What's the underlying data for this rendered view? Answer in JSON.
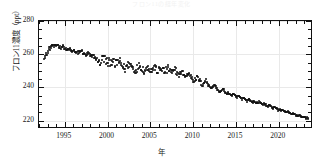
{
  "chart_data": {
    "type": "scatter",
    "title": "フロン11の経年変化",
    "xlabel": "年",
    "ylabel": "フロン11濃度（ppt）",
    "xlim": [
      1992,
      2024
    ],
    "ylim": [
      215,
      280
    ],
    "xticks": [
      1995,
      2000,
      2005,
      2010,
      2015,
      2020
    ],
    "yticks": [
      220,
      240,
      260,
      280
    ],
    "xtick_labels": [
      "1995",
      "2000",
      "2005",
      "2010",
      "2015",
      "2020"
    ],
    "ytick_labels": [
      "220",
      "240",
      "260",
      "280"
    ],
    "xtick_minor_step": 1,
    "ytick_minor_step": 5,
    "grid": true,
    "legend": null,
    "marker": "filled-circle",
    "marker_color": "#111111",
    "series": [
      {
        "name": "フロン11濃度",
        "units": "ppt",
        "x": [
          1992.6,
          1992.8,
          1993.0,
          1993.2,
          1993.4,
          1993.5,
          1993.7,
          1993.9,
          1994.1,
          1994.3,
          1994.5,
          1994.7,
          1994.9,
          1995.1,
          1995.3,
          1995.5,
          1995.7,
          1995.9,
          1996.1,
          1996.3,
          1996.5,
          1996.7,
          1996.9,
          1997.1,
          1997.3,
          1997.5,
          1997.7,
          1997.9,
          1998.1,
          1998.3,
          1998.5,
          1998.7,
          1998.9,
          1999.1,
          1999.3,
          1999.5,
          1999.7,
          1999.9,
          2000.1,
          2000.3,
          2000.5,
          2000.7,
          2000.9,
          2001.1,
          2001.3,
          2001.5,
          2001.7,
          2001.9,
          2002.1,
          2002.3,
          2002.5,
          2002.7,
          2002.9,
          2003.1,
          2003.3,
          2003.5,
          2003.7,
          2003.9,
          2004.1,
          2004.3,
          2004.5,
          2004.7,
          2004.9,
          2005.1,
          2005.3,
          2005.5,
          2005.7,
          2005.9,
          2006.1,
          2006.3,
          2006.5,
          2006.7,
          2006.9,
          2007.1,
          2007.3,
          2007.5,
          2007.7,
          2007.9,
          2008.1,
          2008.3,
          2008.5,
          2008.7,
          2008.9,
          2009.1,
          2009.3,
          2009.5,
          2009.7,
          2009.9,
          2010.1,
          2010.3,
          2010.5,
          2010.7,
          2010.9,
          2011.1,
          2011.3,
          2011.5,
          2011.7,
          2011.9,
          2012.1,
          2012.3,
          2012.5,
          2012.7,
          2012.9,
          2013.1,
          2013.3,
          2013.5,
          2013.7,
          2013.9,
          2014.1,
          2014.3,
          2014.5,
          2014.7,
          2014.9,
          2015.1,
          2015.3,
          2015.5,
          2015.7,
          2015.9,
          2016.1,
          2016.3,
          2016.5,
          2016.7,
          2016.9,
          2017.1,
          2017.3,
          2017.5,
          2017.7,
          2017.9,
          2018.1,
          2018.3,
          2018.5,
          2018.7,
          2018.9,
          2019.1,
          2019.3,
          2019.5,
          2019.7,
          2019.9,
          2020.1,
          2020.3,
          2020.5,
          2020.7,
          2020.9,
          2021.1,
          2021.3,
          2021.5,
          2021.7,
          2021.9,
          2022.1,
          2022.3,
          2022.5,
          2022.7,
          2022.9,
          2023.1,
          2023.3,
          2023.5
        ],
        "y": [
          258.0,
          259.5,
          261.0,
          263.5,
          264.0,
          265.5,
          264.5,
          265.0,
          266.0,
          265.0,
          264.0,
          265.0,
          264.0,
          263.0,
          262.5,
          263.5,
          262.0,
          261.5,
          262.5,
          261.0,
          260.5,
          261.5,
          262.0,
          261.0,
          260.0,
          259.5,
          260.5,
          259.5,
          258.5,
          259.0,
          258.0,
          257.0,
          256.0,
          254.5,
          256.5,
          258.0,
          257.0,
          255.5,
          254.0,
          255.5,
          256.5,
          255.0,
          253.5,
          255.0,
          256.0,
          254.5,
          253.0,
          252.0,
          251.5,
          253.0,
          254.5,
          253.5,
          252.5,
          251.0,
          250.0,
          252.0,
          253.5,
          252.5,
          251.0,
          249.5,
          251.0,
          252.5,
          251.5,
          250.0,
          251.5,
          252.5,
          251.0,
          249.5,
          251.0,
          252.0,
          250.5,
          249.0,
          250.5,
          251.5,
          250.0,
          248.5,
          249.5,
          250.5,
          249.0,
          247.5,
          248.5,
          249.5,
          248.0,
          246.5,
          247.5,
          248.5,
          247.0,
          245.5,
          244.0,
          245.0,
          246.0,
          244.5,
          243.0,
          241.5,
          243.0,
          244.0,
          242.5,
          241.0,
          239.5,
          240.5,
          241.5,
          240.0,
          238.5,
          237.0,
          238.0,
          239.0,
          237.5,
          236.0,
          237.0,
          236.0,
          235.0,
          236.0,
          235.0,
          234.0,
          235.0,
          234.0,
          233.0,
          234.0,
          233.0,
          232.0,
          233.0,
          232.0,
          231.0,
          232.0,
          231.0,
          230.5,
          231.5,
          230.5,
          229.5,
          230.5,
          229.5,
          228.5,
          229.5,
          228.5,
          227.5,
          228.5,
          227.5,
          226.5,
          227.0,
          226.0,
          226.5,
          225.5,
          225.0,
          225.5,
          224.5,
          224.0,
          224.5,
          223.5,
          223.0,
          223.5,
          222.5,
          222.0,
          222.5,
          222.0,
          221.5,
          222.0
        ],
        "scatter_noise_pre2005": true
      }
    ],
    "summary": {
      "peak_value": 266.0,
      "peak_year": 1994,
      "start_value": 258.0,
      "start_year": 1992.6,
      "end_value": 222.0,
      "end_year": 2023.5
    }
  }
}
